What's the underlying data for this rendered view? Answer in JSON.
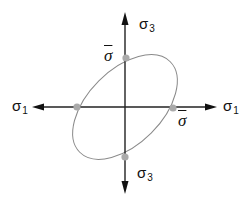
{
  "diagram": {
    "title": "",
    "axes": {
      "horizontal": {
        "symbol": "σ",
        "subscript": "1"
      },
      "vertical": {
        "symbol": "σ",
        "subscript": "3"
      }
    },
    "labels": {
      "sigma1_left": {
        "symbol": "σ",
        "subscript": "1"
      },
      "sigma1_right": {
        "symbol": "σ",
        "subscript": "1"
      },
      "sigma3_top": {
        "symbol": "σ",
        "subscript": "3"
      },
      "sigma3_bottom": {
        "symbol": "σ",
        "subscript": "3"
      },
      "sigma_bar_top": "σ",
      "sigma_bar_right": "σ"
    },
    "ellipse": {
      "shape": "yield-locus-ellipse",
      "rotation_deg": -45,
      "stroke": "#888888"
    },
    "points": [
      {
        "name": "top-intercept",
        "label": "σ̄"
      },
      {
        "name": "right-intercept",
        "label": "σ̄"
      },
      {
        "name": "left-intercept",
        "label": ""
      },
      {
        "name": "bottom-intercept",
        "label": ""
      }
    ],
    "colors": {
      "axis": "#111111",
      "ellipse": "#8a8a8a",
      "point": "#aaaaaa",
      "text": "#111111"
    }
  }
}
